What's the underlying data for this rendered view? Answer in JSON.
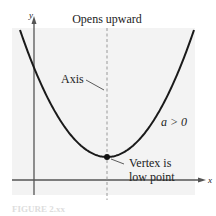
{
  "figure": {
    "title": "Opens upward",
    "axis_label": "Axis",
    "condition_label": "a > 0",
    "vertex_label_line1": "Vertex is",
    "vertex_label_line2": "low point",
    "x_axis_label": "x",
    "y_axis_label": "y",
    "caption": "FIGURE 2.xx"
  },
  "colors": {
    "plot_background": "#f3f3f3",
    "curve": "#1a1a1a",
    "axes": "#555555",
    "axis_of_symmetry": "#999999",
    "caption": "#dddddd"
  }
}
